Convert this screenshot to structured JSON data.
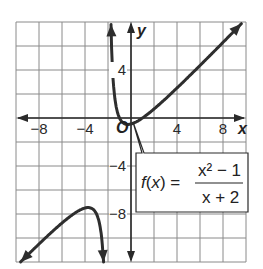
{
  "chart_data": {
    "type": "line",
    "title": "",
    "xlabel": "x",
    "ylabel": "y",
    "origin_label": "O",
    "xlim": [
      -10,
      10
    ],
    "ylim": [
      -12,
      8
    ],
    "grid": true,
    "grid_step": 2,
    "x_ticks": [
      -8,
      -4,
      4,
      8
    ],
    "x_tick_labels": [
      "−8",
      "−4",
      "4",
      "8"
    ],
    "y_ticks": [
      4,
      -4,
      -8
    ],
    "y_tick_labels": [
      "4",
      "−4",
      "−8"
    ],
    "vertical_asymptote": -2,
    "function_label": {
      "lhs": "f(x) =",
      "numerator": "x² − 1",
      "denominator": "x + 2"
    },
    "series": [
      {
        "name": "right branch",
        "domain": [
          -1.74,
          9.6
        ],
        "formula": "(x^2-1)/(x+2)"
      },
      {
        "name": "left branch",
        "domain": [
          -9.6,
          -2.35
        ],
        "formula": "(x^2-1)/(x+2)"
      }
    ]
  }
}
